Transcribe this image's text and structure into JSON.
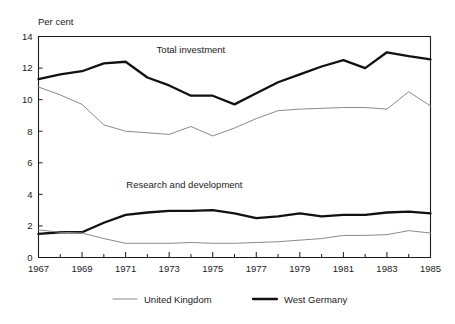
{
  "chart_data": {
    "type": "line",
    "title": "",
    "xlabel": "",
    "ylabel": "Per cent",
    "ylim": [
      0,
      14
    ],
    "xlim": [
      1967,
      1985
    ],
    "yticks": [
      0,
      2,
      4,
      6,
      8,
      10,
      12,
      14
    ],
    "xticks": [
      1967,
      1969,
      1971,
      1973,
      1975,
      1977,
      1979,
      1981,
      1983,
      1985
    ],
    "x_minor_ticks": [
      1968,
      1970,
      1972,
      1974,
      1976,
      1978,
      1980,
      1982,
      1984
    ],
    "grid": false,
    "legend_position": "bottom",
    "x": [
      1967,
      1968,
      1969,
      1970,
      1971,
      1972,
      1973,
      1974,
      1975,
      1976,
      1977,
      1978,
      1979,
      1980,
      1981,
      1982,
      1983,
      1984,
      1985
    ],
    "annotations": [
      {
        "text": "Total investment",
        "x": 1974.0,
        "y": 13.2
      },
      {
        "text": "Research and development",
        "x": 1973.7,
        "y": 4.6
      }
    ],
    "series": [
      {
        "name": "Total investment — West Germany",
        "legend": "West Germany",
        "group": "Total investment",
        "country": "West Germany",
        "color": "#111111",
        "line_width": 2.3,
        "values": [
          11.3,
          11.6,
          11.8,
          12.3,
          12.4,
          11.4,
          10.9,
          10.25,
          10.25,
          9.7,
          10.4,
          11.1,
          11.6,
          12.1,
          12.5,
          12.0,
          13.0,
          12.75,
          12.55
        ]
      },
      {
        "name": "Total investment — United Kingdom",
        "legend": "United Kingdom",
        "group": "Total investment",
        "country": "United Kingdom",
        "color": "#8a8a8a",
        "line_width": 1.0,
        "values": [
          10.8,
          10.3,
          9.7,
          8.4,
          8.0,
          7.9,
          7.8,
          8.3,
          7.7,
          8.2,
          8.8,
          9.3,
          9.4,
          9.45,
          9.5,
          9.5,
          9.4,
          10.5,
          9.6
        ]
      },
      {
        "name": "Research and development — West Germany",
        "legend": "West Germany",
        "group": "Research and development",
        "country": "West Germany",
        "color": "#111111",
        "line_width": 2.3,
        "values": [
          1.5,
          1.6,
          1.6,
          2.2,
          2.7,
          2.85,
          2.95,
          2.95,
          3.0,
          2.8,
          2.5,
          2.6,
          2.8,
          2.6,
          2.7,
          2.7,
          2.85,
          2.9,
          2.8
        ]
      },
      {
        "name": "Research and development — United Kingdom",
        "legend": "United Kingdom",
        "group": "Research and development",
        "country": "United Kingdom",
        "color": "#8a8a8a",
        "line_width": 1.0,
        "values": [
          1.75,
          1.6,
          1.55,
          1.2,
          0.9,
          0.9,
          0.9,
          0.95,
          0.9,
          0.9,
          0.95,
          1.0,
          1.1,
          1.2,
          1.4,
          1.4,
          1.45,
          1.7,
          1.55
        ]
      }
    ],
    "legend": [
      {
        "label": "United Kingdom",
        "color": "#8a8a8a",
        "line_width": 1.0
      },
      {
        "label": "West Germany",
        "color": "#111111",
        "line_width": 2.3
      }
    ]
  }
}
